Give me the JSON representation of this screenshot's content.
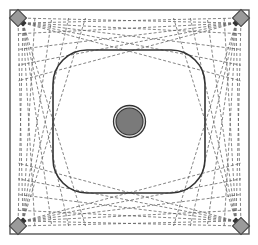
{
  "diagram": {
    "width": 258,
    "height": 245,
    "colors": {
      "background": "#ffffff",
      "frame_stroke": "#555555",
      "inner_stroke": "#333333",
      "ray_stroke": "#666666",
      "sensor_fill": "#9a9a9a",
      "sensor_stroke": "#444444",
      "target_fill": "#7a7a7a",
      "target_stroke": "#333333"
    },
    "outer_frame": {
      "x": 10,
      "y": 10,
      "w": 239,
      "h": 224
    },
    "inner_region": {
      "x": 53,
      "y": 50,
      "w": 152,
      "h": 143,
      "rx": 34
    },
    "target": {
      "cx": 129.5,
      "cy": 121.5,
      "r": 16,
      "inner_r": 13.5
    },
    "sensors": [
      {
        "id": "top-left",
        "x": 18,
        "y": 18
      },
      {
        "id": "top-right",
        "x": 241,
        "y": 18
      },
      {
        "id": "bottom-left",
        "x": 18,
        "y": 226
      },
      {
        "id": "bottom-right",
        "x": 241,
        "y": 226
      }
    ],
    "rays_per_side": 5
  }
}
